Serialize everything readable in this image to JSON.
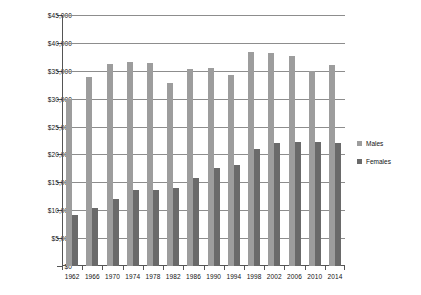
{
  "chart_data": {
    "type": "bar",
    "title": "",
    "subtitle": "",
    "xlabel": "",
    "ylabel": "",
    "ylim": [
      0,
      45000
    ],
    "ytick_step": 5000,
    "grid": true,
    "legend_position": "right",
    "categories": [
      "1962",
      "1966",
      "1970",
      "1974",
      "1978",
      "1982",
      "1986",
      "1990",
      "1994",
      "1998",
      "2002",
      "2006",
      "2010",
      "2014"
    ],
    "ytick_labels": [
      "$45,000",
      "$40,000",
      "$35,000",
      "$30,000",
      "$25,000",
      "$20,000",
      "$15,000",
      "$10,000",
      "$5,000",
      "$0"
    ],
    "ytick_values": [
      45000,
      40000,
      35000,
      30000,
      25000,
      20000,
      15000,
      10000,
      5000,
      0
    ],
    "series": [
      {
        "name": "Males",
        "color": "#9d9d9d",
        "values": [
          29900,
          33800,
          36300,
          36600,
          36400,
          32900,
          35300,
          35500,
          34200,
          38300,
          38200,
          37700,
          35000,
          36000
        ]
      },
      {
        "name": "Females",
        "color": "#6a6a6a",
        "values": [
          9100,
          10400,
          12100,
          13600,
          13700,
          14000,
          15800,
          17500,
          18100,
          20900,
          22100,
          22300,
          22200,
          22000
        ]
      }
    ]
  }
}
